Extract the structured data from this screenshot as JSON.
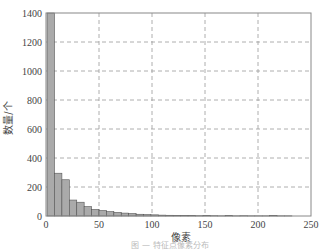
{
  "chart_data": {
    "type": "bar",
    "title": "",
    "xlabel": "像素",
    "ylabel": "数量/个",
    "xlim": [
      0,
      250
    ],
    "ylim": [
      0,
      1400
    ],
    "xticks": [
      0,
      50,
      100,
      150,
      200,
      250
    ],
    "yticks": [
      0,
      200,
      400,
      600,
      800,
      1000,
      1200,
      1400
    ],
    "grid": true,
    "bin_width": 7,
    "bin_start": 1,
    "values": [
      1400,
      295,
      250,
      110,
      95,
      65,
      45,
      38,
      30,
      25,
      20,
      17,
      12,
      10,
      8,
      6,
      5,
      4,
      3,
      3,
      2,
      3,
      2,
      1,
      3,
      1,
      2,
      1,
      1,
      1,
      3,
      1,
      1,
      0,
      0,
      0
    ],
    "bar_color": "#aaaaaa",
    "edge_color": "#555555"
  },
  "caption": "图 — 特征点像素分布"
}
